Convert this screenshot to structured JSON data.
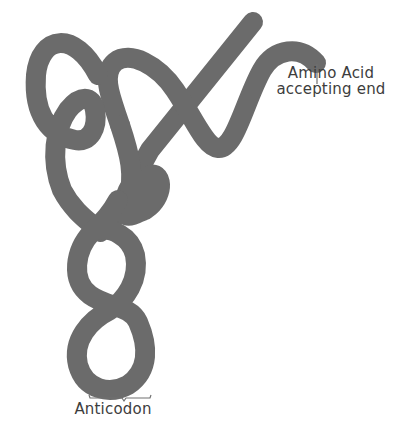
{
  "diagram": {
    "strand_color": "#6b6b6b",
    "background": "#ffffff",
    "labels": {
      "amino_acid_line1": "Amino Acid",
      "amino_acid_line2": "accepting end",
      "anticodon": "Anticodon"
    }
  }
}
